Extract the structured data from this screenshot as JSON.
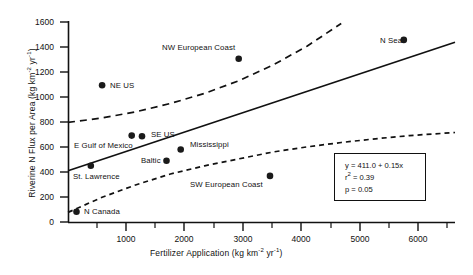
{
  "chart_data": {
    "type": "scatter",
    "title": "",
    "xlabel": "Fertilizer Application (kg km-2 yr-1)",
    "ylabel": "Riverine N Flux per Area (kg km-2 yr-1)",
    "xlim": [
      0,
      6800
    ],
    "ylim": [
      0,
      1600
    ],
    "grid": false,
    "legend": "none",
    "x_ticks": [
      1000,
      2000,
      3000,
      4000,
      5000,
      6000
    ],
    "x_tick_labels": [
      "1000",
      "2000",
      "3000",
      "4000",
      "5000",
      "6000"
    ],
    "x_minor_ticks": [
      500,
      1500,
      2500,
      3500,
      4500,
      5500,
      6500
    ],
    "y_ticks": [
      0,
      200,
      400,
      600,
      800,
      1000,
      1200,
      1400,
      1600
    ],
    "y_tick_labels": [
      "0",
      "200",
      "400",
      "600",
      "800",
      "1000",
      "1200",
      "1400",
      "1600"
    ],
    "points": [
      {
        "label": "NE US",
        "x": 600,
        "y": 1090,
        "label_side": "right"
      },
      {
        "label": "NW European Coast",
        "x": 3000,
        "y": 1300,
        "label_side": "left"
      },
      {
        "label": "N Sea",
        "x": 5900,
        "y": 1450,
        "label_side": "left"
      },
      {
        "label": "E Gulf of Mexico",
        "x": 1120,
        "y": 690,
        "label_side": "left-below"
      },
      {
        "label": "SE US",
        "x": 1300,
        "y": 685,
        "label_side": "right"
      },
      {
        "label": "Mississippi",
        "x": 1980,
        "y": 580,
        "label_side": "right-above"
      },
      {
        "label": "Baltic",
        "x": 1730,
        "y": 490,
        "label_side": "left"
      },
      {
        "label": "St. Lawrence",
        "x": 400,
        "y": 450,
        "label_side": "right-below"
      },
      {
        "label": "SW European Coast",
        "x": 3550,
        "y": 370,
        "label_side": "left-below"
      },
      {
        "label": "N Canada",
        "x": 150,
        "y": 85,
        "label_side": "right"
      }
    ],
    "fit_line": {
      "name": "regression",
      "style": "solid",
      "equation": "y = 411.0 + 0.15x",
      "x_start": 0,
      "y_start": 411,
      "x_end": 6800,
      "y_end": 1431
    },
    "confidence_bands": [
      {
        "name": "upper-confidence-band",
        "style": "dashed",
        "x": [
          0,
          600,
          1200,
          1800,
          2400,
          3000,
          3600,
          4200,
          4800
        ],
        "y": [
          795,
          830,
          880,
          945,
          1025,
          1125,
          1250,
          1400,
          1580
        ]
      },
      {
        "name": "lower-confidence-band",
        "style": "dashed",
        "x": [
          0,
          600,
          1200,
          1800,
          2400,
          3000,
          3600,
          4200,
          4800,
          5400,
          6000,
          6800
        ],
        "y": [
          80,
          200,
          300,
          385,
          450,
          505,
          560,
          600,
          635,
          665,
          690,
          715
        ]
      }
    ],
    "annotations": {
      "stats_box": {
        "equation": "y = 411.0 + 0.15x",
        "r_squared_label": "r",
        "r_squared_sup": "2",
        "r_squared_value": " = 0.39",
        "p_value": "p = 0.05"
      }
    }
  },
  "axes": {
    "y_title_main": "Riverine N Flux per Area (kg km",
    "y_title_sup1": "-2",
    "y_title_mid": " yr",
    "y_title_sup2": "-1",
    "y_title_end": ")",
    "x_title_main": "Fertilizer Application (kg km",
    "x_title_sup1": "-2",
    "x_title_mid": " yr",
    "x_title_sup2": "-1",
    "x_title_end": ")"
  }
}
